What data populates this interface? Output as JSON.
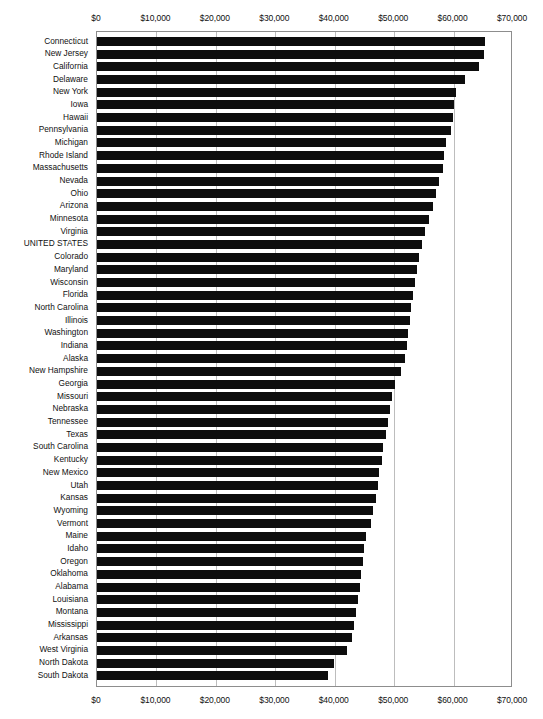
{
  "chart_data": {
    "type": "bar",
    "orientation": "horizontal",
    "title": "",
    "xlabel": "",
    "ylabel": "",
    "xlim": [
      0,
      70000
    ],
    "grid": true,
    "legend": null,
    "tick_format": "$#,##0",
    "xticks": [
      0,
      10000,
      20000,
      30000,
      40000,
      50000,
      60000,
      70000
    ],
    "xtick_labels": [
      "$0",
      "$10,000",
      "$20,000",
      "$30,000",
      "$40,000",
      "$50,000",
      "$60,000",
      "$70,000"
    ],
    "axis_position": "both",
    "bar_color": "#0d0d0d",
    "categories": [
      "Connecticut",
      "New Jersey",
      "California",
      "Delaware",
      "New York",
      "Iowa",
      "Hawaii",
      "Pennsylvania",
      "Michigan",
      "Rhode Island",
      "Massachusetts",
      "Nevada",
      "Ohio",
      "Arizona",
      "Minnesota",
      "Virginia",
      "UNITED STATES",
      "Colorado",
      "Maryland",
      "Wisconsin",
      "Florida",
      "North Carolina",
      "Illinois",
      "Washington",
      "Indiana",
      "Alaska",
      "New Hampshire",
      "Georgia",
      "Missouri",
      "Nebraska",
      "Tennessee",
      "Texas",
      "South Carolina",
      "Kentucky",
      "New Mexico",
      "Utah",
      "Kansas",
      "Wyoming",
      "Vermont",
      "Maine",
      "Idaho",
      "Oregon",
      "Oklahoma",
      "Alabama",
      "Louisiana",
      "Montana",
      "Mississippi",
      "Arkansas",
      "West Virginia",
      "North Dakota",
      "South Dakota"
    ],
    "values": [
      65300,
      65100,
      64300,
      62000,
      60400,
      60100,
      59900,
      59500,
      58800,
      58400,
      58200,
      57600,
      57000,
      56500,
      55800,
      55200,
      54700,
      54200,
      53900,
      53500,
      53200,
      52900,
      52700,
      52400,
      52100,
      51800,
      51200,
      50100,
      49600,
      49300,
      48900,
      48600,
      48200,
      47900,
      47500,
      47200,
      46900,
      46500,
      46100,
      45300,
      45000,
      44700,
      44400,
      44200,
      43900,
      43500,
      43200,
      42900,
      42000,
      39900,
      38900
    ]
  },
  "a11y": {
    "chart_name": "median-income-by-state-bar-chart"
  }
}
